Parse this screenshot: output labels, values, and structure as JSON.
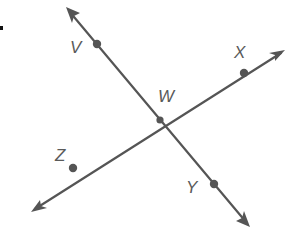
{
  "diagram": {
    "type": "intersecting-lines",
    "colors": {
      "line": "#555555",
      "point": "#555555",
      "label": "#5a5a5a",
      "background": "#ffffff"
    },
    "intersection": {
      "label": "W",
      "x": 160,
      "y": 120
    },
    "lines": [
      {
        "name": "line VY",
        "points": [
          "V",
          "W",
          "Y"
        ],
        "start_arrow": {
          "x": 66,
          "y": 7
        },
        "end_arrow": {
          "x": 250,
          "y": 227
        }
      },
      {
        "name": "line ZX",
        "points": [
          "Z",
          "W",
          "X"
        ],
        "start_arrow": {
          "x": 31,
          "y": 212
        },
        "end_arrow": {
          "x": 285,
          "y": 50
        }
      }
    ],
    "points": [
      {
        "label": "V",
        "x": 97,
        "y": 44
      },
      {
        "label": "W",
        "x": 160,
        "y": 120
      },
      {
        "label": "X",
        "x": 244,
        "y": 73
      },
      {
        "label": "Z",
        "x": 73,
        "y": 168
      },
      {
        "label": "Y",
        "x": 214,
        "y": 184
      }
    ],
    "labels": {
      "V": "V",
      "W": "W",
      "X": "X",
      "Y": "Y",
      "Z": "Z"
    }
  }
}
